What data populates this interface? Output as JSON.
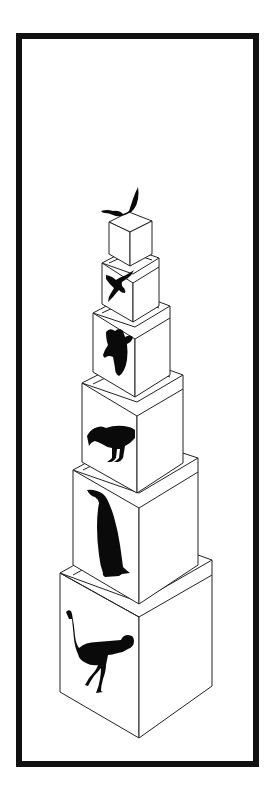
{
  "diagram": {
    "frame_color": "#111111",
    "background": "#ffffff",
    "boxes_bottom_to_top": [
      {
        "index": 1,
        "bird": "ostrich",
        "silhouette_icon": "ostrich-icon"
      },
      {
        "index": 2,
        "bird": "penguin",
        "silhouette_icon": "penguin-icon"
      },
      {
        "index": 3,
        "bird": "ground bird",
        "silhouette_icon": "ground-bird-icon"
      },
      {
        "index": 4,
        "bird": "pigeon",
        "silhouette_icon": "pigeon-icon"
      },
      {
        "index": 5,
        "bird": "swallow",
        "silhouette_icon": "swallow-icon"
      },
      {
        "index": 6,
        "bird": "flying bird (on top)",
        "silhouette_icon": "flying-bird-icon"
      }
    ]
  }
}
